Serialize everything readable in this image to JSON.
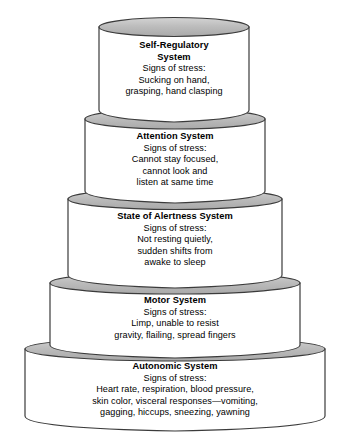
{
  "diagram": {
    "name": "Stacked cylinder tier diagram of infant behavioral systems",
    "type": "layered-stack",
    "colors": {
      "ellipse_fill": "#b9b9b9",
      "ellipse_highlight": "#d7d7d7",
      "body_fill": "#ffffff",
      "outline": "#3b3b3b",
      "text": "#000000"
    },
    "tiers": [
      {
        "id": "self-regulatory",
        "title": "Self-Regulatory System",
        "title_lines": [
          "Self-Regulatory",
          "System"
        ],
        "subtitle": "Signs of stress:",
        "body_lines": [
          "Sucking on hand,",
          "grasping, hand clasping"
        ],
        "level": 5,
        "position": "top"
      },
      {
        "id": "attention",
        "title": "Attention System",
        "title_lines": [
          "Attention System"
        ],
        "subtitle": "Signs of stress:",
        "body_lines": [
          "Cannot stay focused,",
          "cannot look and",
          "listen at same time"
        ],
        "level": 4,
        "position": "second"
      },
      {
        "id": "state-of-alertness",
        "title": "State of Alertness System",
        "title_lines": [
          "State of Alertness System"
        ],
        "subtitle": "Signs of stress:",
        "body_lines": [
          "Not resting quietly,",
          "sudden shifts from",
          "awake to sleep"
        ],
        "level": 3,
        "position": "middle"
      },
      {
        "id": "motor",
        "title": "Motor System",
        "title_lines": [
          "Motor System"
        ],
        "subtitle": "Signs of stress:",
        "body_lines": [
          "Limp, unable to resist",
          "gravity, flailing, spread fingers"
        ],
        "level": 2,
        "position": "fourth"
      },
      {
        "id": "autonomic",
        "title": "Autonomic System",
        "title_lines": [
          "Autonomic System"
        ],
        "subtitle": "Signs of stress:",
        "body_lines": [
          "Heart rate, respiration, blood pressure,",
          "skin color, visceral responses—vomiting,",
          "gagging, hiccups, sneezing, yawning"
        ],
        "level": 1,
        "position": "base"
      }
    ]
  }
}
